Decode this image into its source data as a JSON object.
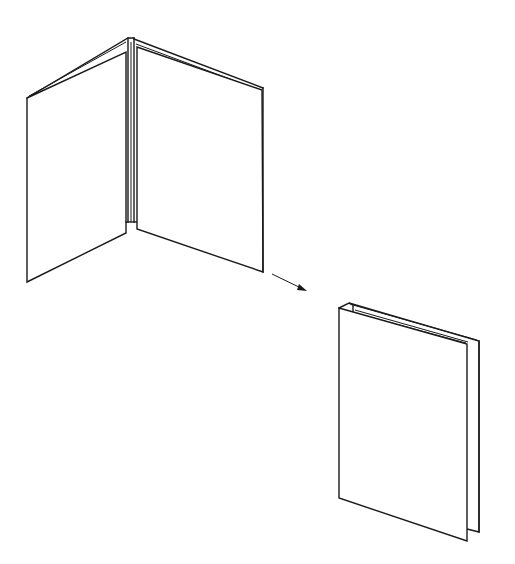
{
  "figure": {
    "stroke_color": "#1a1a1a",
    "background_color": "#ffffff",
    "elements": {
      "open_booklet": {
        "label": "open-booklet"
      },
      "arrow": {
        "label": "transition-arrow"
      },
      "closed_booklet": {
        "label": "closed-booklet"
      }
    }
  }
}
